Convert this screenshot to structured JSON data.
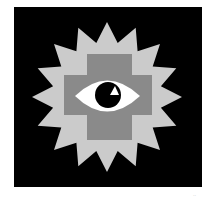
{
  "image": {
    "description": "Eye icon inside a gray cross on a 16-point light-gray starburst over a black square",
    "icon_name": "eye-starburst-cross-icon",
    "colors": {
      "page_background": "#ffffff",
      "frame": "#000000",
      "starburst": "#cbcbcb",
      "cross": "#8a8a8a",
      "eye_white": "#ffffff",
      "pupil": "#000000",
      "highlight": "#ffffff"
    },
    "starburst": {
      "points": 16,
      "center": [
        107,
        97
      ],
      "outer_radius": 75,
      "inner_radius": 55
    }
  },
  "corner_mark": "··"
}
